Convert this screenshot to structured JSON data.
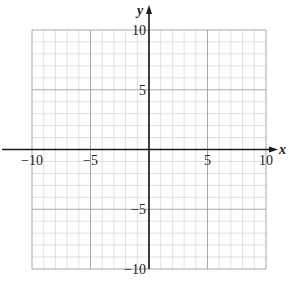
{
  "chart_data": {
    "type": "scatter",
    "title": "",
    "xlabel": "x",
    "ylabel": "y",
    "xlim": [
      -10,
      10
    ],
    "ylim": [
      -10,
      10
    ],
    "grid": true,
    "grid_minor_step": 1,
    "grid_major_step": 5,
    "x_ticks": [
      -10,
      -5,
      5,
      10
    ],
    "y_ticks": [
      10,
      5,
      -5,
      -10
    ],
    "x_tick_labels": [
      "−10",
      "−5",
      "5",
      "10"
    ],
    "y_tick_labels": [
      "10",
      "5",
      "−5",
      "−10"
    ],
    "series": [],
    "colors": {
      "minor_grid": "#d9d9d9",
      "major_grid": "#a8a8a8",
      "axis": "#1a1a1a"
    }
  }
}
